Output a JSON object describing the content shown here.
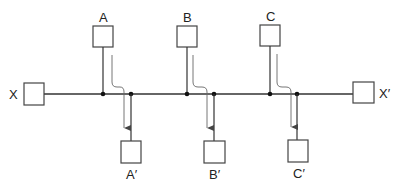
{
  "diagram": {
    "type": "bus-flow",
    "colors": {
      "stroke": "#333333",
      "flow": "#555555",
      "background": "#ffffff"
    },
    "source": {
      "label": "X"
    },
    "sink": {
      "label": "X′"
    },
    "stations": [
      {
        "input_label": "A",
        "output_label": "A′"
      },
      {
        "input_label": "B",
        "output_label": "B′"
      },
      {
        "input_label": "C",
        "output_label": "C′"
      }
    ]
  }
}
